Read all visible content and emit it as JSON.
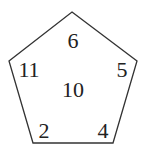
{
  "diagram": {
    "shape": "pentagon",
    "stroke_color": "#333333",
    "vertices": [
      [
        72,
        12
      ],
      [
        137,
        61
      ],
      [
        113,
        143
      ],
      [
        33,
        143
      ],
      [
        9,
        61
      ]
    ],
    "labels": {
      "top": "6",
      "right": "5",
      "bottom_right": "4",
      "bottom_left": "2",
      "left": "11",
      "center": "10"
    }
  }
}
